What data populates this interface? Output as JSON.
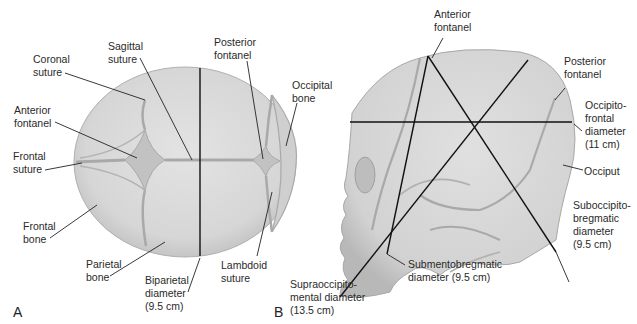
{
  "panels": {
    "A": {
      "letter": "A",
      "labels": {
        "sagittal_suture": "Sagittal\nsuture",
        "posterior_fontanel": "Posterior\nfontanel",
        "coronal_suture": "Coronal\nsuture",
        "occipital_bone": "Occipital\nbone",
        "anterior_fontanel": "Anterior\nfontanel",
        "frontal_suture": "Frontal\nsuture",
        "frontal_bone": "Frontal\nbone",
        "parietal_bone": "Parietal\nbone",
        "biparietal_diameter": "Biparietal\ndiameter\n(9.5 cm)",
        "lambdoid_suture": "Lambdoid\nsuture"
      }
    },
    "B": {
      "letter": "B",
      "labels": {
        "anterior_fontanel": "Anterior\nfontanel",
        "posterior_fontanel": "Posterior\nfontanel",
        "occipitofrontal_diameter": "Occipito-\nfrontal\ndiameter\n(11 cm)",
        "occiput": "Occiput",
        "suboccipitobregmatic_diameter": "Suboccipito-\nbregmatic\ndiameter\n(9.5 cm)",
        "submentobregmatic_diameter": "Submentobregmatic\ndiameter (9.5 cm)",
        "supraoccipitomental_diameter": "Supraoccipito-\nmental diameter\n(13.5 cm)"
      }
    }
  },
  "colors": {
    "bone_fill": "#dcdcdc",
    "bone_shade": "#c4c4c4",
    "suture": "#a9a9a9",
    "line": "#111111",
    "text": "#2a2a2a"
  }
}
